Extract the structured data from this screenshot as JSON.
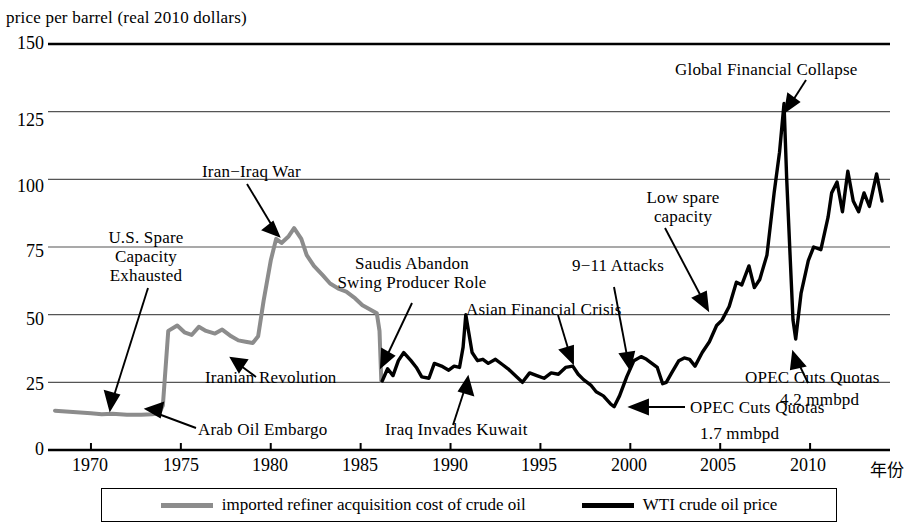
{
  "chart_data": {
    "type": "line",
    "title": "price per barrel  (real 2010 dollars)",
    "xlabel": "年份",
    "ylabel": "",
    "xlim": [
      1968,
      2014
    ],
    "ylim": [
      0,
      150
    ],
    "grid": true,
    "yticks": [
      "0",
      "25",
      "50",
      "75",
      "100",
      "125",
      "150"
    ],
    "ytick_values": [
      0,
      25,
      50,
      75,
      100,
      125,
      150
    ],
    "xticks": [
      "1970",
      "1975",
      "1980",
      "1985",
      "1990",
      "1995",
      "2000",
      "2005",
      "2010"
    ],
    "xtick_values": [
      1970,
      1975,
      1980,
      1985,
      1990,
      1995,
      2000,
      2005,
      2010
    ],
    "legend_position": "bottom",
    "series": [
      {
        "name": "imported refiner acquisition cost of crude oil",
        "color": "#8c8c8c",
        "x": [
          1968.0,
          1969.0,
          1970.0,
          1970.6,
          1971.2,
          1972.0,
          1972.8,
          1973.4,
          1973.8,
          1974.0,
          1974.3,
          1974.8,
          1975.2,
          1975.6,
          1976.0,
          1976.4,
          1976.9,
          1977.3,
          1977.8,
          1978.2,
          1978.6,
          1979.0,
          1979.3,
          1979.6,
          1980.0,
          1980.3,
          1980.6,
          1981.0,
          1981.3,
          1981.7,
          1982.0,
          1982.4,
          1982.9,
          1983.3,
          1983.8,
          1984.2,
          1984.7,
          1985.1,
          1985.5,
          1985.9,
          1986.05,
          1986.15
        ],
        "y": [
          14.5,
          14.0,
          13.6,
          13.2,
          13.4,
          13.0,
          13.0,
          13.2,
          13.6,
          16.5,
          44.0,
          46.0,
          43.5,
          42.5,
          45.5,
          44.0,
          43.0,
          44.5,
          42.0,
          40.5,
          40.0,
          39.5,
          42.0,
          55.0,
          70.0,
          78.0,
          76.5,
          79.0,
          82.0,
          78.0,
          72.0,
          68.0,
          64.5,
          61.5,
          59.5,
          58.5,
          56.0,
          53.5,
          52.0,
          50.5,
          44.0,
          25.5
        ]
      },
      {
        "name": "WTI crude oil price",
        "color": "#000000",
        "x": [
          1986.2,
          1986.5,
          1986.8,
          1987.1,
          1987.4,
          1987.8,
          1988.1,
          1988.4,
          1988.8,
          1989.1,
          1989.5,
          1989.9,
          1990.2,
          1990.5,
          1990.7,
          1990.85,
          1991.0,
          1991.2,
          1991.5,
          1991.8,
          1992.1,
          1992.5,
          1992.9,
          1993.2,
          1993.6,
          1994.0,
          1994.4,
          1994.8,
          1995.2,
          1995.6,
          1996.0,
          1996.4,
          1996.8,
          1997.1,
          1997.4,
          1997.8,
          1998.1,
          1998.5,
          1998.9,
          1999.1,
          1999.4,
          1999.8,
          2000.2,
          2000.6,
          2000.9,
          2001.2,
          2001.5,
          2001.8,
          2002.0,
          2002.3,
          2002.7,
          2003.0,
          2003.3,
          2003.6,
          2004.0,
          2004.4,
          2004.8,
          2005.1,
          2005.5,
          2005.9,
          2006.2,
          2006.6,
          2006.9,
          2007.2,
          2007.6,
          2008.0,
          2008.3,
          2008.55,
          2008.7,
          2008.9,
          2009.05,
          2009.2,
          2009.5,
          2009.9,
          2010.2,
          2010.6,
          2011.0,
          2011.2,
          2011.5,
          2011.8,
          2012.1,
          2012.4,
          2012.7,
          2013.0,
          2013.3,
          2013.7,
          2014.0
        ],
        "y": [
          25.5,
          30.0,
          27.5,
          33.0,
          36.0,
          33.0,
          30.5,
          27.0,
          26.5,
          32.0,
          31.0,
          29.5,
          31.0,
          30.5,
          38.0,
          50.0,
          44.0,
          36.0,
          33.0,
          33.5,
          32.0,
          33.5,
          31.5,
          30.0,
          27.5,
          25.0,
          28.5,
          27.5,
          26.5,
          28.5,
          28.0,
          30.5,
          31.0,
          28.0,
          26.0,
          24.0,
          21.5,
          20.0,
          17.0,
          16.0,
          20.0,
          27.0,
          33.0,
          34.5,
          33.5,
          32.0,
          30.5,
          24.5,
          25.0,
          28.5,
          33.0,
          34.0,
          33.5,
          31.0,
          36.0,
          40.0,
          46.0,
          48.0,
          53.0,
          62.0,
          61.0,
          68.0,
          60.0,
          63.0,
          72.0,
          95.0,
          110.0,
          128.0,
          100.0,
          70.0,
          48.0,
          41.0,
          58.0,
          70.0,
          75.0,
          74.0,
          86.0,
          95.0,
          99.0,
          88.0,
          103.0,
          92.0,
          88.0,
          95.0,
          90.0,
          102.0,
          92.0
        ]
      }
    ],
    "annotations": [
      {
        "id": "us-spare-capacity",
        "text": [
          "U.S. Spare",
          "Capacity",
          "Exhausted"
        ]
      },
      {
        "id": "arab-oil-embargo",
        "text": [
          "Arab Oil Embargo"
        ]
      },
      {
        "id": "iranian-revolution",
        "text": [
          "Iranian  Revolution"
        ]
      },
      {
        "id": "iran-iraq-war",
        "text": [
          "Iran−Iraq War"
        ]
      },
      {
        "id": "saudis-abandon-swing",
        "text": [
          "Saudis Abandon",
          "Swing Producer Role"
        ]
      },
      {
        "id": "iraq-invades-kuwait",
        "text": [
          "Iraq Invades Kuwait"
        ]
      },
      {
        "id": "asian-financial-crisis",
        "text": [
          "Asian Financial Crisis"
        ]
      },
      {
        "id": "opec-cuts-quotas-1-7",
        "text": [
          "OPEC Cuts Quotas",
          "1.7 mmbpd"
        ]
      },
      {
        "id": "nine-eleven-attacks",
        "text": [
          "9−11  Attacks"
        ]
      },
      {
        "id": "low-spare-capacity",
        "text": [
          "Low spare",
          "capacity"
        ]
      },
      {
        "id": "global-financial-collapse",
        "text": [
          "Global Financial Collapse"
        ]
      },
      {
        "id": "opec-cuts-quotas-4-2",
        "text": [
          "OPEC Cuts Quotas",
          "4.2 mmbpd"
        ]
      }
    ]
  },
  "axis": {
    "title": "price per barrel  (real 2010 dollars)",
    "x_title": "年份",
    "y_labels": [
      "150",
      "125",
      "100",
      "75",
      "50",
      "25",
      "0"
    ],
    "x_labels": [
      "1970",
      "1975",
      "1980",
      "1985",
      "1990",
      "1995",
      "2000",
      "2005",
      "2010"
    ]
  },
  "annotations_text": {
    "us_spare_1": "U.S. Spare",
    "us_spare_2": "Capacity",
    "us_spare_3": "Exhausted",
    "arab_embargo": "Arab Oil Embargo",
    "iranian_revolution": "Iranian  Revolution",
    "iran_iraq_war": "Iran−Iraq War",
    "saudis_1": "Saudis Abandon",
    "saudis_2": "Swing Producer Role",
    "iraq_kuwait": "Iraq Invades Kuwait",
    "asian_crisis": "Asian Financial Crisis",
    "opec_17_1": "OPEC Cuts Quotas",
    "opec_17_2": "1.7 mmbpd",
    "nine_eleven": "9−11  Attacks",
    "low_spare_1": "Low spare",
    "low_spare_2": "capacity",
    "global_collapse": "Global Financial Collapse",
    "opec_42_1": "OPEC Cuts Quotas",
    "opec_42_2": "4.2 mmbpd"
  },
  "legend": {
    "items": [
      {
        "label": "imported refiner acquisition cost of crude oil",
        "color": "#8c8c8c"
      },
      {
        "label": "WTI crude oil price",
        "color": "#000000"
      }
    ]
  }
}
